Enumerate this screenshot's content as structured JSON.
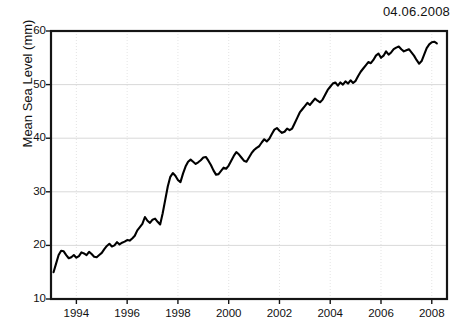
{
  "annotation": {
    "date": "04.06.2008"
  },
  "chart_data": {
    "type": "line",
    "title": "",
    "subtitle": "",
    "xlabel": "",
    "ylabel": "Mean Sea Level (mm)",
    "xlim": [
      1993.0,
      2008.6
    ],
    "ylim": [
      10,
      60
    ],
    "xticks": [
      1994,
      1996,
      1998,
      2000,
      2002,
      2004,
      2006,
      2008
    ],
    "xtick_labels": [
      "1994",
      "1996",
      "1998",
      "2000",
      "2002",
      "2004",
      "2006",
      "2008"
    ],
    "yticks": [
      10,
      20,
      30,
      40,
      50,
      60
    ],
    "ytick_labels": [
      "10",
      "20",
      "30",
      "40",
      "50",
      "60"
    ],
    "grid": true,
    "grid_color": "#c9c9c9",
    "legend": null,
    "legend_position": "none",
    "line_color": "#000000",
    "annotations": [
      {
        "text": "04.06.2008",
        "position": "top-right"
      }
    ],
    "series": [
      {
        "name": "Mean Sea Level",
        "units": "mm",
        "x": [
          1993.1,
          1993.2,
          1993.3,
          1993.4,
          1993.5,
          1993.6,
          1993.7,
          1993.8,
          1993.9,
          1994.0,
          1994.1,
          1994.2,
          1994.3,
          1994.4,
          1994.5,
          1994.6,
          1994.7,
          1994.8,
          1994.9,
          1995.0,
          1995.1,
          1995.2,
          1995.3,
          1995.4,
          1995.5,
          1995.6,
          1995.7,
          1995.8,
          1995.9,
          1996.0,
          1996.1,
          1996.2,
          1996.3,
          1996.4,
          1996.5,
          1996.6,
          1996.7,
          1996.8,
          1996.9,
          1997.0,
          1997.1,
          1997.2,
          1997.3,
          1997.4,
          1997.5,
          1997.6,
          1997.7,
          1997.8,
          1997.9,
          1998.0,
          1998.1,
          1998.2,
          1998.3,
          1998.4,
          1998.5,
          1998.6,
          1998.7,
          1998.8,
          1998.9,
          1999.0,
          1999.1,
          1999.2,
          1999.3,
          1999.4,
          1999.5,
          1999.6,
          1999.7,
          1999.8,
          1999.9,
          2000.0,
          2000.1,
          2000.2,
          2000.3,
          2000.4,
          2000.5,
          2000.6,
          2000.7,
          2000.8,
          2000.9,
          2001.0,
          2001.1,
          2001.2,
          2001.3,
          2001.4,
          2001.5,
          2001.6,
          2001.7,
          2001.8,
          2001.9,
          2002.0,
          2002.1,
          2002.2,
          2002.3,
          2002.4,
          2002.5,
          2002.6,
          2002.7,
          2002.8,
          2002.9,
          2003.0,
          2003.1,
          2003.2,
          2003.3,
          2003.4,
          2003.5,
          2003.6,
          2003.7,
          2003.8,
          2003.9,
          2004.0,
          2004.1,
          2004.2,
          2004.3,
          2004.4,
          2004.5,
          2004.6,
          2004.7,
          2004.8,
          2004.9,
          2005.0,
          2005.1,
          2005.2,
          2005.3,
          2005.4,
          2005.5,
          2005.6,
          2005.7,
          2005.8,
          2005.9,
          2006.0,
          2006.1,
          2006.2,
          2006.3,
          2006.4,
          2006.5,
          2006.6,
          2006.7,
          2006.8,
          2006.9,
          2007.0,
          2007.1,
          2007.2,
          2007.3,
          2007.4,
          2007.5,
          2007.6,
          2007.7,
          2007.8,
          2007.9,
          2008.0,
          2008.1,
          2008.2
        ],
        "y": [
          15.0,
          16.6,
          18.2,
          19.0,
          18.9,
          18.2,
          17.6,
          17.8,
          18.2,
          17.7,
          18.0,
          18.7,
          18.5,
          18.2,
          18.8,
          18.4,
          17.9,
          17.8,
          18.2,
          18.6,
          19.3,
          19.9,
          20.3,
          19.8,
          20.0,
          20.6,
          20.2,
          20.5,
          20.7,
          21.0,
          20.9,
          21.3,
          21.8,
          22.8,
          23.4,
          24.0,
          25.3,
          24.6,
          24.2,
          24.8,
          25.0,
          24.4,
          23.9,
          26.0,
          28.5,
          31.0,
          32.8,
          33.5,
          33.0,
          32.2,
          31.8,
          33.4,
          34.7,
          35.6,
          36.0,
          35.6,
          35.2,
          35.5,
          35.9,
          36.4,
          36.5,
          35.8,
          35.0,
          34.0,
          33.2,
          33.3,
          33.9,
          34.5,
          34.3,
          34.9,
          35.8,
          36.7,
          37.4,
          37.0,
          36.4,
          35.8,
          35.6,
          36.4,
          37.2,
          37.8,
          38.2,
          38.5,
          39.2,
          39.8,
          39.4,
          39.9,
          40.8,
          41.6,
          41.9,
          41.4,
          41.0,
          41.2,
          41.8,
          41.5,
          41.8,
          42.8,
          43.8,
          44.8,
          45.4,
          46.0,
          46.6,
          46.2,
          46.8,
          47.4,
          47.0,
          46.7,
          47.2,
          48.1,
          49.0,
          49.6,
          50.2,
          50.4,
          49.8,
          50.4,
          50.0,
          50.6,
          50.2,
          50.8,
          50.3,
          50.7,
          51.6,
          52.4,
          53.0,
          53.6,
          54.2,
          54.0,
          54.6,
          55.4,
          55.8,
          55.0,
          55.4,
          56.2,
          55.6,
          56.0,
          56.6,
          56.9,
          57.1,
          56.6,
          56.2,
          56.4,
          56.6,
          56.0,
          55.4,
          54.6,
          53.9,
          54.4,
          55.6,
          56.8,
          57.5,
          57.9,
          58.0,
          57.7
        ]
      }
    ]
  }
}
